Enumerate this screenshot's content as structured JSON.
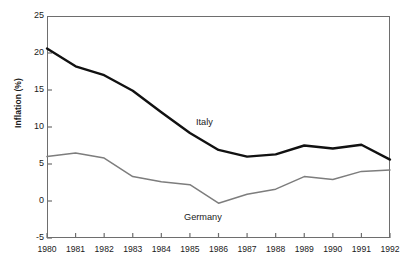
{
  "chart_data": {
    "type": "line",
    "title": "",
    "xlabel": "",
    "ylabel": "Inflation (%)",
    "xlim": [
      1980,
      1992
    ],
    "ylim": [
      -5,
      25
    ],
    "grid": false,
    "legend_position": "inline-annotation",
    "x": [
      1980,
      1981,
      1982,
      1983,
      1984,
      1985,
      1986,
      1987,
      1988,
      1989,
      1990,
      1991,
      1992
    ],
    "categories": [
      "1980",
      "1981",
      "1982",
      "1983",
      "1984",
      "1985",
      "1986",
      "1987",
      "1988",
      "1989",
      "1990",
      "1991",
      "1992"
    ],
    "y_ticks": [
      -5,
      0,
      5,
      10,
      15,
      20,
      25
    ],
    "y_tick_labels": [
      "-5",
      "0",
      "5",
      "10",
      "15",
      "20",
      "25"
    ],
    "series": [
      {
        "name": "Italy",
        "color": "#111111",
        "line_width": 2.4,
        "values": [
          20.6,
          18.2,
          17.0,
          14.9,
          12.0,
          9.2,
          6.9,
          6.0,
          6.3,
          7.5,
          7.1,
          7.6,
          5.6
        ]
      },
      {
        "name": "Germany",
        "color": "#7d7d7d",
        "line_width": 1.5,
        "values": [
          6.0,
          6.5,
          5.8,
          3.3,
          2.6,
          2.2,
          -0.3,
          0.9,
          1.6,
          3.3,
          2.9,
          4.0,
          4.2
        ]
      }
    ],
    "annotations": [
      {
        "text": "Italy",
        "x": 1986.3,
        "y": 10.0
      },
      {
        "text": "Germany",
        "x": 1985.8,
        "y": -2.4
      }
    ]
  },
  "axes": {
    "y_title": "Inflation (%)"
  }
}
